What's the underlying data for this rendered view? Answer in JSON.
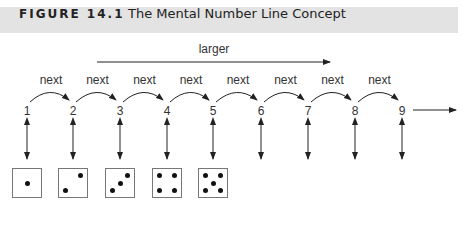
{
  "figure": {
    "label": "FIGURE 14.1",
    "title": "The Mental Number Line Concept"
  },
  "larger_label": "larger",
  "next_label": "next",
  "numbers": [
    "1",
    "2",
    "3",
    "4",
    "5",
    "6",
    "7",
    "8",
    "9"
  ],
  "next_arcs": [
    "next",
    "next",
    "next",
    "next",
    "next",
    "next",
    "next",
    "next"
  ],
  "dice": [
    {
      "value": 1,
      "pips": [
        [
          0.5,
          0.5
        ]
      ]
    },
    {
      "value": 2,
      "pips": [
        [
          0.22,
          0.78
        ],
        [
          0.78,
          0.22
        ]
      ]
    },
    {
      "value": 3,
      "pips": [
        [
          0.22,
          0.78
        ],
        [
          0.5,
          0.5
        ],
        [
          0.78,
          0.22
        ]
      ]
    },
    {
      "value": 4,
      "pips": [
        [
          0.22,
          0.22
        ],
        [
          0.78,
          0.22
        ],
        [
          0.22,
          0.78
        ],
        [
          0.78,
          0.78
        ]
      ]
    },
    {
      "value": 5,
      "pips": [
        [
          0.22,
          0.22
        ],
        [
          0.78,
          0.22
        ],
        [
          0.5,
          0.5
        ],
        [
          0.22,
          0.78
        ],
        [
          0.78,
          0.78
        ]
      ]
    }
  ],
  "colors": {
    "header_band": "#e3e3e3",
    "line": "#222222",
    "die_border": "#777777",
    "pip": "#111111"
  }
}
